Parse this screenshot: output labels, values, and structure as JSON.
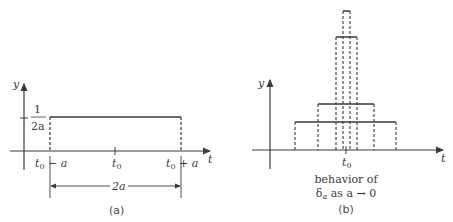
{
  "panel_a": {
    "y_axis_label": "y",
    "t_axis_label": "t",
    "height_label_num": "1",
    "height_label_den": "2a",
    "tick_left": "t0 − a",
    "tick_left_base": "t",
    "tick_left_sub": "0",
    "tick_left_rest": " − a",
    "tick_center_base": "t",
    "tick_center_sub": "0",
    "tick_right_base": "t",
    "tick_right_sub": "0",
    "tick_right_rest": " + a",
    "width_label": "2a",
    "caption": "(a)"
  },
  "panel_b": {
    "y_axis_label": "y",
    "t_axis_label": "t",
    "tick_center_base": "t",
    "tick_center_sub": "0",
    "description_line1": "behavior of",
    "description_delta": "δ",
    "description_delta_sub": "a",
    "description_rest": " as a → 0",
    "caption": "(b)"
  },
  "colors": {
    "line": "#3a3a3a",
    "background": "#ffffff"
  }
}
